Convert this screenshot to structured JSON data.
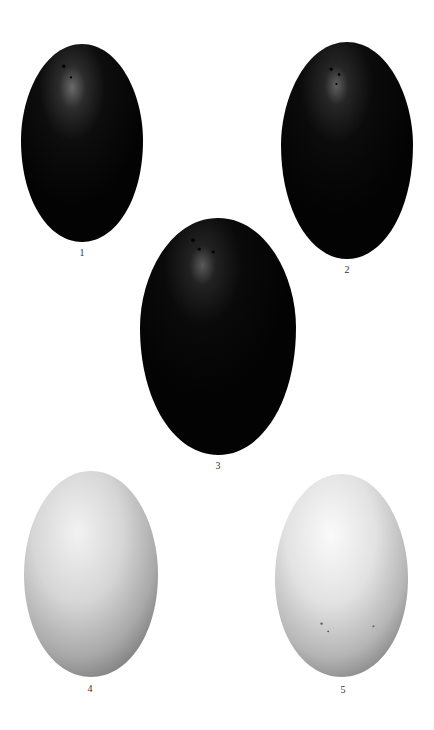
{
  "plate": {
    "background": "#ffffff",
    "specimens": [
      {
        "number": "1",
        "label": "1",
        "tone": "dark",
        "box": {
          "x": 21,
          "y": 44,
          "w": 122,
          "h": 198
        },
        "label_pos": {
          "x": 82,
          "y": 247
        }
      },
      {
        "number": "2",
        "label": "2",
        "tone": "dark",
        "box": {
          "x": 281,
          "y": 42,
          "w": 132,
          "h": 217
        },
        "label_pos": {
          "x": 347,
          "y": 264
        }
      },
      {
        "number": "3",
        "label": "3",
        "tone": "dark",
        "box": {
          "x": 140,
          "y": 218,
          "w": 156,
          "h": 237
        },
        "label_pos": {
          "x": 218,
          "y": 460
        }
      },
      {
        "number": "4",
        "label": "4",
        "tone": "light",
        "box": {
          "x": 24,
          "y": 471,
          "w": 134,
          "h": 206
        },
        "label_pos": {
          "x": 90,
          "y": 683
        }
      },
      {
        "number": "5",
        "label": "5",
        "tone": "light",
        "box": {
          "x": 275,
          "y": 474,
          "w": 133,
          "h": 203
        },
        "label_pos": {
          "x": 343,
          "y": 684
        }
      }
    ],
    "colors": {
      "dark_egg_base": "#050505",
      "dark_egg_highlight": "#6a6a6a",
      "light_egg_base": "#d8d8d8",
      "light_egg_highlight": "#f7f7f7",
      "light_egg_shadow": "#8a8a8a",
      "label_color": "#333333"
    }
  }
}
